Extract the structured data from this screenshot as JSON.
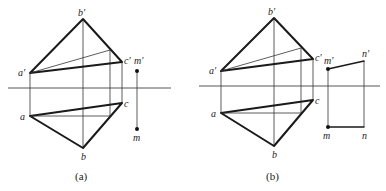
{
  "figure": {
    "panels": [
      {
        "caption": "(a)",
        "labels": {
          "b_prime": "b′",
          "a_prime": "a′",
          "c_prime": "c′",
          "m_prime": "m′",
          "a": "a",
          "b": "b",
          "c": "c",
          "m": "m"
        }
      },
      {
        "caption": "(b)",
        "labels": {
          "b_prime": "b′",
          "a_prime": "a′",
          "c_prime": "c′",
          "m_prime": "m′",
          "n_prime": "n′",
          "a": "a",
          "b": "b",
          "c": "c",
          "m": "m",
          "n": "n"
        }
      }
    ],
    "colors": {
      "line": "#1a1a1a",
      "background": "#ffffff"
    }
  }
}
